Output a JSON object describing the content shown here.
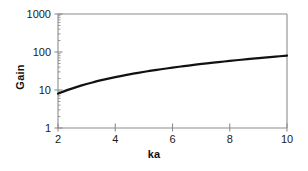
{
  "chart_data": {
    "type": "line",
    "title": "",
    "subtitle": "",
    "xlabel": "ka",
    "ylabel": "Gain",
    "xscale": "linear",
    "yscale": "log",
    "xlim": [
      2,
      10
    ],
    "ylim": [
      1,
      1000
    ],
    "grid": false,
    "legend": null,
    "xticks": [
      {
        "value": 2,
        "label": "2"
      },
      {
        "value": 4,
        "label": "4"
      },
      {
        "value": 6,
        "label": "6"
      },
      {
        "value": 8,
        "label": "8"
      },
      {
        "value": 10,
        "label": "10"
      }
    ],
    "yticks": [
      {
        "value": 1,
        "label": "1"
      },
      {
        "value": 10,
        "label": "10"
      },
      {
        "value": 100,
        "label": "100"
      },
      {
        "value": 1000,
        "label": "1000"
      }
    ],
    "series": [
      {
        "name": "Gain vs ka",
        "color": "#111111",
        "linewidth": 2.2,
        "x": [
          2.0,
          2.4,
          2.8,
          3.2,
          3.6,
          4.0,
          4.4,
          4.8,
          5.2,
          5.6,
          6.0,
          6.4,
          6.8,
          7.2,
          7.6,
          8.0,
          8.4,
          8.8,
          9.2,
          9.6,
          10.0
        ],
        "y": [
          8.0,
          10.4,
          13.0,
          15.8,
          18.7,
          21.8,
          25.0,
          28.3,
          31.7,
          35.2,
          38.8,
          42.5,
          46.3,
          50.2,
          54.2,
          58.3,
          62.5,
          66.8,
          71.2,
          75.7,
          80.3
        ]
      }
    ]
  },
  "axes": {
    "frame_color": "#8c8c8c",
    "tick_color": "#8c8c8c",
    "text_color": "#1a1a1a"
  }
}
